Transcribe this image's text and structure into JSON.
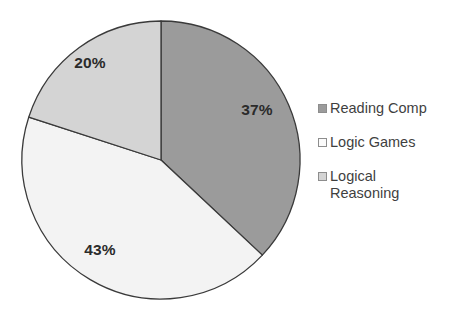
{
  "chart_data": {
    "type": "pie",
    "title": "",
    "categories": [
      "Reading Comp",
      "Logic Games",
      "Logical Reasoning"
    ],
    "values": [
      37,
      43,
      20
    ],
    "value_labels": [
      "37%",
      "43%",
      "20%"
    ],
    "unit": "percent",
    "total": 100,
    "start_angle_deg": 0,
    "direction": "clockwise",
    "legend_position": "right",
    "grid": false,
    "slice_colors": [
      "#9b9b9b",
      "#f3f3f3",
      "#d4d4d4"
    ],
    "slice_border_color": "#3a3a3a",
    "background_color": "#ffffff",
    "label_text_color": "#2b2b2b",
    "legend_text_color": "#3f3f3f",
    "slices": [
      {
        "name": "Reading Comp",
        "value": 37,
        "label": "37%",
        "color": "#9b9b9b",
        "label_x": 257,
        "label_y": 115
      },
      {
        "name": "Logic Games",
        "value": 43,
        "label": "43%",
        "color": "#f3f3f3",
        "label_x": 100,
        "label_y": 255
      },
      {
        "name": "Logical Reasoning",
        "value": 20,
        "label": "20%",
        "color": "#d4d4d4",
        "label_x": 90,
        "label_y": 68
      }
    ]
  },
  "legend": {
    "items": [
      {
        "label": "Reading Comp",
        "marker_color": "#9b9b9b"
      },
      {
        "label": "Logic Games",
        "marker_color": "#fbfbfb"
      },
      {
        "label": "Logical\nReasoning",
        "marker_color": "#d4d4d4"
      }
    ]
  }
}
